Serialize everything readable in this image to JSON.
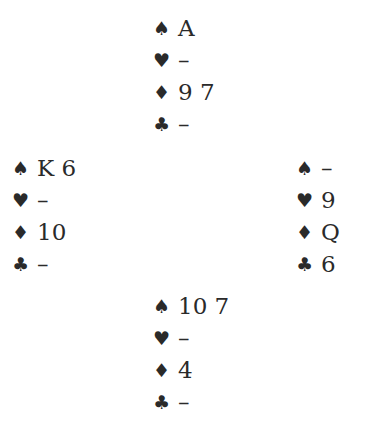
{
  "diagram": {
    "type": "bridge-deal",
    "suit_symbols": {
      "spades": "♠",
      "hearts": "♥",
      "diamonds": "♦",
      "clubs": "♣"
    },
    "hands": {
      "north": {
        "spades": "A",
        "hearts": "–",
        "diamonds": "9 7",
        "clubs": "–"
      },
      "west": {
        "spades": "K 6",
        "hearts": "–",
        "diamonds": "10",
        "clubs": "–"
      },
      "east": {
        "spades": "–",
        "hearts": "9",
        "diamonds": "Q",
        "clubs": "6"
      },
      "south": {
        "spades": "10 7",
        "hearts": "–",
        "diamonds": "4",
        "clubs": "–"
      }
    }
  }
}
